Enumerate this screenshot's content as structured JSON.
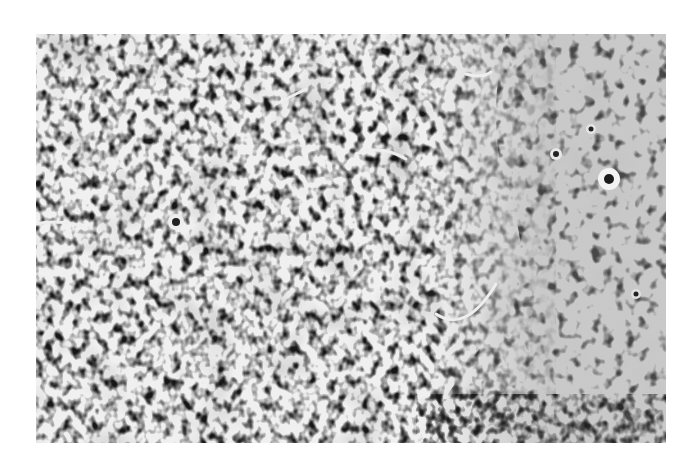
{
  "figure": {
    "type": "grayscale-histology-micrograph",
    "colors": {
      "background": "#ffffff",
      "dense_nuclei": "#1a1a1a",
      "stroma_light": "#c8c8c8",
      "keratin_pale": "#bdbdbd"
    }
  }
}
